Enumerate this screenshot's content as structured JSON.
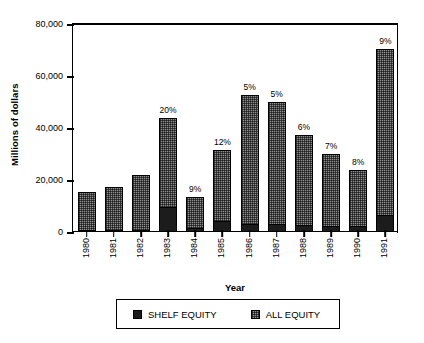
{
  "chart_data": {
    "type": "bar",
    "subtype": "stacked-bar",
    "title": "",
    "xlabel": "Year",
    "ylabel": "Millions of dollars",
    "categories": [
      "1980",
      "1981",
      "1982",
      "1983",
      "1984",
      "1985",
      "1986",
      "1987",
      "1988",
      "1989",
      "1990",
      "1991"
    ],
    "ylim": [
      0,
      80000
    ],
    "yticks": [
      0,
      20000,
      40000,
      60000,
      80000
    ],
    "ytick_labels": [
      "0",
      "20,000",
      "40,000",
      "60,000",
      "80,000"
    ],
    "grid": false,
    "legend_position": "bottom",
    "series": [
      {
        "name": "SHELF EQUITY",
        "color": "#1c1c1c",
        "values": [
          0,
          0,
          0,
          9200,
          1200,
          3800,
          2700,
          2600,
          2200,
          2100,
          1900,
          6300
        ]
      },
      {
        "name": "ALL EQUITY",
        "color": "#8f8f8f",
        "values": [
          15000,
          16800,
          21500,
          43500,
          13000,
          31000,
          52500,
          49500,
          37000,
          29500,
          23500,
          70000
        ]
      }
    ],
    "annotations": [
      {
        "category": "1980",
        "text": ""
      },
      {
        "category": "1981",
        "text": ""
      },
      {
        "category": "1982",
        "text": ""
      },
      {
        "category": "1983",
        "text": "20%"
      },
      {
        "category": "1984",
        "text": "9%"
      },
      {
        "category": "1985",
        "text": "12%"
      },
      {
        "category": "1986",
        "text": "5%"
      },
      {
        "category": "1987",
        "text": "5%"
      },
      {
        "category": "1988",
        "text": "6%"
      },
      {
        "category": "1989",
        "text": "7%"
      },
      {
        "category": "1990",
        "text": "8%"
      },
      {
        "category": "1991",
        "text": "9%"
      }
    ],
    "legend": [
      {
        "label": "SHELF EQUITY",
        "swatch": "shelf"
      },
      {
        "label": "ALL EQUITY",
        "swatch": "all"
      }
    ]
  }
}
